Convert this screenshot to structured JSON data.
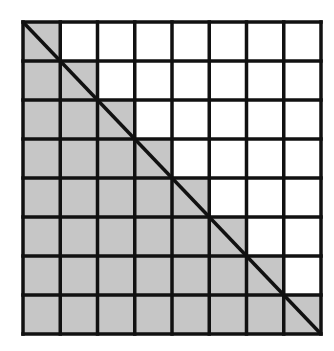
{
  "diagram": {
    "type": "grid-staircase",
    "rows": 8,
    "cols": 8,
    "shading_rule": "cell shaded when column index <= row index (staircase including diagonal cells)",
    "diagonal": "top-left to bottom-right",
    "colors": {
      "shaded": "#c6c6c6",
      "unshaded": "#ffffff",
      "lines": "#111111"
    },
    "geometry": {
      "x0": 23,
      "y0": 22,
      "x1": 321,
      "y1": 334,
      "line_width": 3.5,
      "diagonal_width": 3.5
    }
  }
}
